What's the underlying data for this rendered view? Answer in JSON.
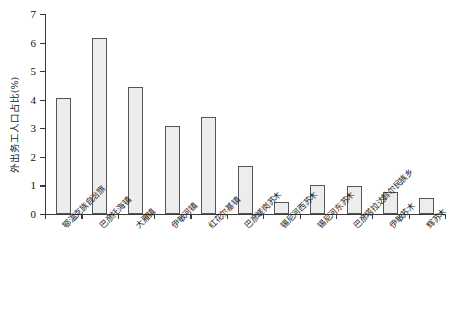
{
  "chart_data": {
    "type": "bar",
    "title": "",
    "xlabel": "",
    "ylabel": "外出务工人口占比(%)",
    "ylim": [
      0,
      7
    ],
    "yticks": [
      0,
      1,
      2,
      3,
      4,
      5,
      6,
      7
    ],
    "grid": false,
    "legend": null,
    "categories": [
      "鄂温克族自治旗",
      "巴彦托海镇",
      "大雁镇",
      "伊敏河镇",
      "红花尔基镇",
      "巴彦嵯岗苏木",
      "锡尼河西苏木",
      "锡尼河东苏木",
      "巴彦塔拉达斡尔民族乡",
      "伊敏苏木",
      "辉苏木"
    ],
    "values": [
      4.05,
      6.17,
      4.45,
      3.07,
      3.4,
      1.67,
      0.42,
      1.0,
      0.97,
      0.78,
      0.57
    ],
    "bar_fill": "#ededed",
    "bar_edge": "#555555",
    "axis_color": "#3a3a3a"
  }
}
